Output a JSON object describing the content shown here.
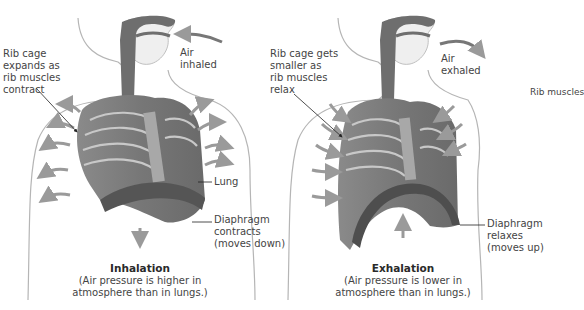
{
  "panels": [
    {
      "name": "inhalation",
      "title": "Inhalation",
      "subtitle_line1": "(Air pressure is higher in",
      "subtitle_line2": "atmosphere than in lungs.)",
      "air_label_line1": "Air",
      "air_label_line2": "inhaled",
      "rib_label_lines": [
        "Rib cage",
        "expands as",
        "rib muscles",
        "contract"
      ],
      "lung_label": "Lung",
      "diaphragm_label_lines": [
        "Diaphragm",
        "contracts",
        "(moves down)"
      ]
    },
    {
      "name": "exhalation",
      "title": "Exhalation",
      "subtitle_line1": "(Air pressure is lower in",
      "subtitle_line2": "atmosphere than in lungs.)",
      "air_label_line1": "Air",
      "air_label_line2": "exhaled",
      "rib_label_lines": [
        "Rib cage gets",
        "smaller as",
        "rib muscles",
        "relax"
      ],
      "diaphragm_label_lines": [
        "Diaphragm",
        "relaxes",
        "(moves up)"
      ]
    }
  ],
  "cropped_label": "Rib muscles",
  "colors": {
    "skin_outline": "#b5b5b5",
    "torso_fill": "#7e7e7e",
    "rib_highlight": "#c8c8c8",
    "arrow": "#9a9a9a",
    "airway": "#6e6e6e"
  }
}
